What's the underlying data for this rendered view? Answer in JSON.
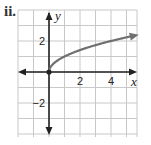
{
  "problem_label": "ii.",
  "chart_data": {
    "type": "line",
    "title": "",
    "function": "y = sqrt(x)",
    "xlabel": "x",
    "ylabel": "y",
    "xlim": [
      -2,
      5.7
    ],
    "ylim": [
      -4,
      4
    ],
    "grid": true,
    "grid_step": 1,
    "x_tick_labels": [
      "2",
      "4"
    ],
    "y_tick_labels": [
      "2",
      "-2"
    ],
    "x_ticks": [
      2,
      4
    ],
    "y_ticks": [
      2,
      -2
    ],
    "series": [
      {
        "name": "curve",
        "color": "#707070",
        "start_point": {
          "x": 0,
          "y": 0,
          "marker": "closed-dot"
        },
        "end": "arrow",
        "x": [
          0,
          0.25,
          0.5,
          1,
          2,
          3,
          4,
          5,
          5.6
        ],
        "y": [
          0,
          0.5,
          0.71,
          1,
          1.41,
          1.73,
          2,
          2.24,
          2.37
        ]
      }
    ],
    "legend": null
  }
}
